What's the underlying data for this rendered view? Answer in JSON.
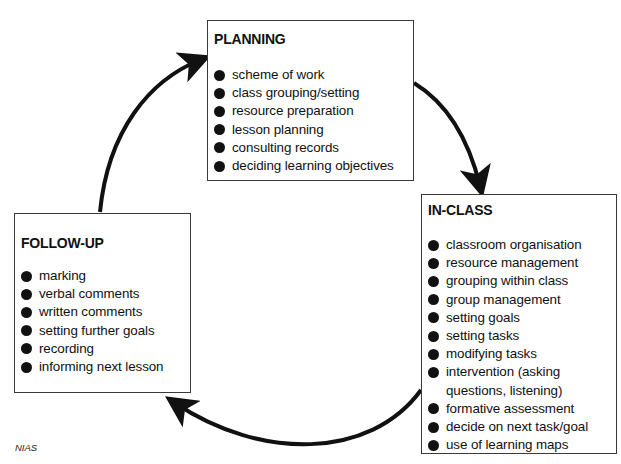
{
  "diagram": {
    "type": "cycle",
    "direction": "clockwise",
    "stages": [
      {
        "id": "planning",
        "title": "PLANNING",
        "items": [
          "scheme of work",
          "class grouping/setting",
          "resource preparation",
          "lesson planning",
          "consulting records",
          "deciding learning objectives"
        ]
      },
      {
        "id": "in-class",
        "title": "IN-CLASS",
        "items": [
          "classroom organisation",
          "resource management",
          "grouping within class",
          "group management",
          "setting goals",
          "setting tasks",
          "modifying tasks",
          "intervention (asking questions, listening)",
          "formative assessment",
          "decide on next task/goal",
          "use of learning maps"
        ]
      },
      {
        "id": "follow-up",
        "title": "FOLLOW-UP",
        "items": [
          "marking",
          "verbal comments",
          "written comments",
          "setting further goals",
          "recording",
          "informing next lesson"
        ]
      }
    ],
    "arrows": [
      {
        "from": "planning",
        "to": "in-class"
      },
      {
        "from": "in-class",
        "to": "follow-up"
      },
      {
        "from": "follow-up",
        "to": "planning"
      }
    ],
    "credit": "NIAS",
    "colors": {
      "line": "#111111",
      "border": "#3a3a3a",
      "background": "#ffffff"
    }
  }
}
